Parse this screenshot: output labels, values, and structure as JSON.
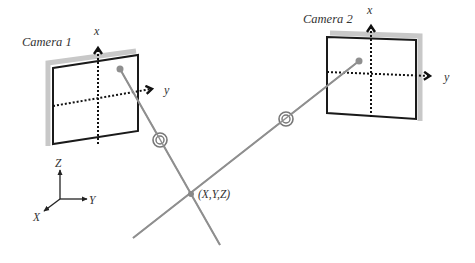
{
  "diagram": {
    "cameras": [
      {
        "label": "Camera 1",
        "axis_x_label": "x",
        "axis_y_label": "y"
      },
      {
        "label": "Camera 2",
        "axis_x_label": "x",
        "axis_y_label": "y"
      }
    ],
    "world_axes": {
      "x_label": "X",
      "y_label": "Y",
      "z_label": "Z"
    },
    "point_label": "(X,Y,Z)",
    "colors": {
      "frame": "#1a1a1a",
      "shadow": "#c8c8c8",
      "ray": "#8f8f8f",
      "text": "#333333"
    }
  }
}
